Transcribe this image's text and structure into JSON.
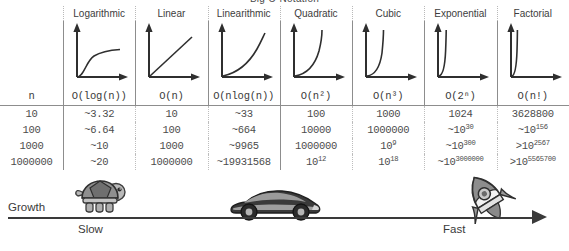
{
  "title": "Big O Notation",
  "table": {
    "n_header": "n",
    "columns": [
      {
        "name": "Logarithmic",
        "bigo": "O(log(n))",
        "curve": "log"
      },
      {
        "name": "Linear",
        "bigo": "O(n)",
        "curve": "linear"
      },
      {
        "name": "Linearithmic",
        "bigo": "O(nlog(n))",
        "curve": "nlogn"
      },
      {
        "name": "Quadratic",
        "bigo": "O(n²)",
        "curve": "quadratic"
      },
      {
        "name": "Cubic",
        "bigo": "O(n³)",
        "curve": "cubic"
      },
      {
        "name": "Exponential",
        "bigo": "O(2ⁿ)",
        "curve": "exponential"
      },
      {
        "name": "Factorial",
        "bigo": "O(n!)",
        "curve": "factorial"
      }
    ],
    "rows": [
      {
        "n": "10",
        "values": [
          "~3.32",
          "10",
          "~33",
          "100",
          "1000",
          "1024",
          "3628800"
        ]
      },
      {
        "n": "100",
        "values": [
          "~6.64",
          "100",
          "~664",
          "10000",
          "1000000",
          "~10^30",
          "~10^156"
        ]
      },
      {
        "n": "1000",
        "values": [
          "~10",
          "1000",
          "~9965",
          "1000000",
          "10^9",
          "~10^300",
          ">10^2567"
        ]
      },
      {
        "n": "1000000",
        "values": [
          "~20",
          "1000000",
          "~19931568",
          "10^12",
          "10^18",
          "~10^3000000",
          ">10^5565700"
        ]
      }
    ]
  },
  "axis": {
    "growth_label": "Growth",
    "slow_label": "Slow",
    "fast_label": "Fast",
    "icons": [
      "turtle-icon",
      "car-icon",
      "rocket-icon"
    ]
  },
  "colors": {
    "text": "#3a3a3a",
    "rule": "#8d8d8d",
    "dotted": "#bdbdbd",
    "axis": "#3a3a3a"
  }
}
